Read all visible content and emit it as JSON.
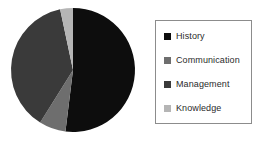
{
  "chart_data": {
    "type": "pie",
    "title": "",
    "categories": [
      "History",
      "Communication",
      "Management",
      "Knowledge"
    ],
    "values": [
      52,
      7,
      38,
      3
    ],
    "unit": "percent",
    "colors": [
      "#0d0d0d",
      "#6e6e6e",
      "#3a3a3a",
      "#b5b5b5"
    ],
    "legend_position": "right",
    "grid": false,
    "start_angle_deg": 0,
    "direction": "clockwise",
    "slices": [
      {
        "label": "History",
        "value": 52,
        "color": "#0d0d0d",
        "start_deg": 0,
        "end_deg": 187
      },
      {
        "label": "Communication",
        "value": 7,
        "color": "#6e6e6e",
        "start_deg": 187,
        "end_deg": 212
      },
      {
        "label": "Management",
        "value": 38,
        "color": "#3a3a3a",
        "start_deg": 212,
        "end_deg": 348
      },
      {
        "label": "Knowledge",
        "value": 3,
        "color": "#b5b5b5",
        "start_deg": 348,
        "end_deg": 360
      }
    ]
  },
  "legend": {
    "items": [
      {
        "label": "History",
        "color": "#0d0d0d"
      },
      {
        "label": "Communication",
        "color": "#6e6e6e"
      },
      {
        "label": "Management",
        "color": "#3a3a3a"
      },
      {
        "label": "Knowledge",
        "color": "#b5b5b5"
      }
    ]
  }
}
